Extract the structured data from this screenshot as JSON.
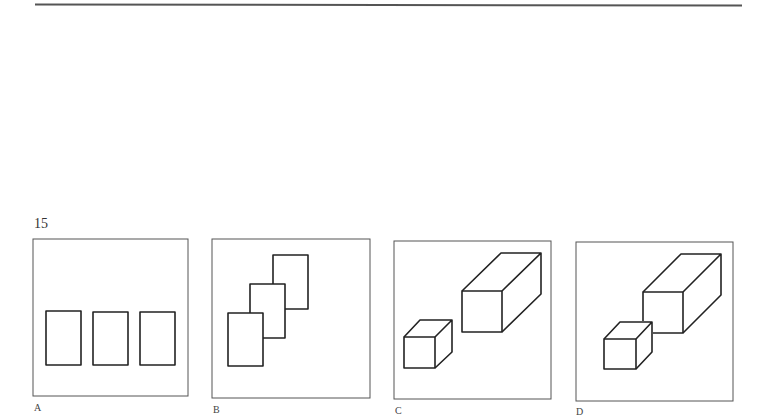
{
  "question": {
    "number": "15"
  },
  "options": [
    {
      "label": "A",
      "description": "three separate rectangles in a row"
    },
    {
      "label": "B",
      "description": "three overlapping rectangles stepping diagonally"
    },
    {
      "label": "C",
      "description": "small cube and long box, separated"
    },
    {
      "label": "D",
      "description": "small cube and long box, touching"
    }
  ],
  "colors": {
    "line": "#222222",
    "frame": "#555555",
    "background": "#ffffff"
  }
}
